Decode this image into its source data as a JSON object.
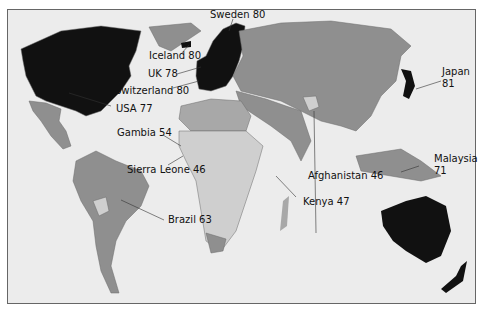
{
  "map": {
    "type": "choropleth",
    "subject": "life expectancy",
    "colors": {
      "ocean": "#ececec",
      "highest": "#111111",
      "high": "#8f8f8f",
      "medium": "#a8a8a8",
      "low": "#cfcfcf",
      "border": "#6a6a6a"
    },
    "labels": [
      {
        "country": "Sweden",
        "value": "80",
        "text": "Sweden 80"
      },
      {
        "country": "Iceland",
        "value": "80",
        "text": "Iceland 80"
      },
      {
        "country": "UK",
        "value": "78",
        "text": "UK 78"
      },
      {
        "country": "Switzerland",
        "value": "80",
        "text": "Switzerland 80"
      },
      {
        "country": "USA",
        "value": "77",
        "text": "USA 77"
      },
      {
        "country": "Gambia",
        "value": "54",
        "text": "Gambia 54"
      },
      {
        "country": "Sierra Leone",
        "value": "46",
        "text": "Sierra Leone 46"
      },
      {
        "country": "Brazil",
        "value": "63",
        "text": "Brazil 63"
      },
      {
        "country": "Afghanistan",
        "value": "46",
        "text": "Afghanistan 46"
      },
      {
        "country": "Kenya",
        "value": "47",
        "text": "Kenya 47"
      },
      {
        "country": "Japan",
        "value": "81",
        "text": "Japan",
        "text2": "81"
      },
      {
        "country": "Malaysia",
        "value": "71",
        "text": "Malaysia",
        "text2": "71"
      }
    ]
  }
}
